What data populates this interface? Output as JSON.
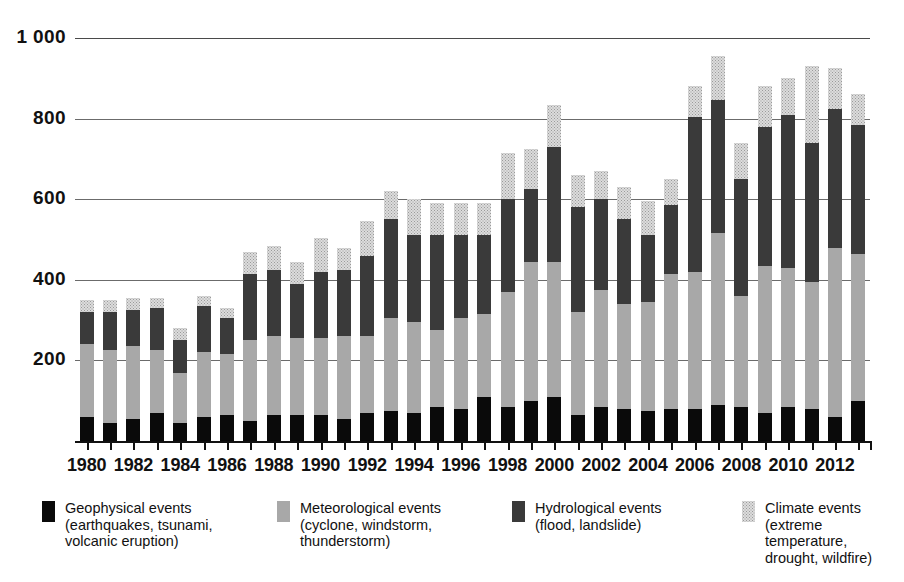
{
  "chart_data": {
    "type": "bar",
    "stacked": true,
    "title": "",
    "subtitle": "",
    "xlabel": "",
    "ylabel": "",
    "ylim": [
      0,
      1000
    ],
    "ytick_labels": [
      "1 000",
      "800",
      "600",
      "400",
      "200"
    ],
    "ytick_values": [
      1000,
      800,
      600,
      400,
      200
    ],
    "grid": true,
    "legend_position": "bottom",
    "categories": [
      "1980",
      "1981",
      "1982",
      "1983",
      "1984",
      "1985",
      "1986",
      "1987",
      "1988",
      "1989",
      "1990",
      "1991",
      "1992",
      "1993",
      "1994",
      "1995",
      "1996",
      "1997",
      "1998",
      "1999",
      "2000",
      "2001",
      "2002",
      "2003",
      "2004",
      "2005",
      "2006",
      "2007",
      "2008",
      "2009",
      "2010",
      "2011",
      "2012",
      "2013"
    ],
    "xtick_labels_shown": [
      "1980",
      "1982",
      "1984",
      "1986",
      "1988",
      "1990",
      "1992",
      "1994",
      "1996",
      "1998",
      "2000",
      "2002",
      "2004",
      "2006",
      "2008",
      "2010",
      "2012"
    ],
    "series": [
      {
        "name": "Geophysical events",
        "color": "#0a0a0a",
        "values": [
          60,
          45,
          55,
          70,
          45,
          60,
          65,
          50,
          65,
          65,
          65,
          55,
          70,
          75,
          70,
          85,
          80,
          110,
          85,
          100,
          110,
          65,
          85,
          80,
          75,
          80,
          80,
          90,
          85,
          70,
          85,
          80,
          60,
          100
        ]
      },
      {
        "name": "Meteorological events",
        "color": "#a8a8a8",
        "values": [
          180,
          180,
          180,
          155,
          125,
          160,
          150,
          200,
          195,
          190,
          190,
          205,
          190,
          230,
          225,
          190,
          225,
          205,
          285,
          345,
          335,
          255,
          290,
          260,
          270,
          335,
          340,
          425,
          275,
          365,
          345,
          315,
          420,
          365
        ]
      },
      {
        "name": "Hydrological events",
        "color": "#3a3a3a",
        "values": [
          80,
          95,
          90,
          105,
          80,
          115,
          90,
          165,
          165,
          135,
          165,
          165,
          200,
          245,
          215,
          235,
          205,
          195,
          230,
          180,
          285,
          260,
          225,
          210,
          165,
          170,
          385,
          330,
          290,
          345,
          380,
          345,
          345,
          320
        ]
      },
      {
        "name": "Climate events",
        "color": "#dcdcdc",
        "values": [
          30,
          30,
          30,
          25,
          30,
          25,
          25,
          55,
          60,
          55,
          85,
          55,
          85,
          70,
          90,
          80,
          80,
          80,
          115,
          100,
          105,
          80,
          70,
          80,
          85,
          65,
          75,
          110,
          90,
          100,
          90,
          190,
          100,
          75
        ]
      }
    ],
    "totals": [
      350,
      350,
      355,
      355,
      280,
      360,
      330,
      470,
      485,
      445,
      505,
      480,
      545,
      620,
      600,
      590,
      590,
      590,
      715,
      725,
      835,
      660,
      670,
      630,
      595,
      650,
      880,
      955,
      740,
      880,
      900,
      930,
      925,
      860
    ]
  },
  "legend": {
    "items": [
      {
        "swatch": "black-swatch",
        "title": "Geophysical events",
        "detail": "(earthquakes, tsunami,\nvolcanic eruption)"
      },
      {
        "swatch": "gray-swatch",
        "title": "Meteorological events",
        "detail": "(cyclone, windstorm,\nthunderstorm)"
      },
      {
        "swatch": "dark-gray-swatch",
        "title": "Hydrological events",
        "detail": "(flood, landslide)"
      },
      {
        "swatch": "light-dotted-swatch",
        "title": "Climate events",
        "detail": "(extreme temperature,\ndrought, wildfire)"
      }
    ]
  }
}
